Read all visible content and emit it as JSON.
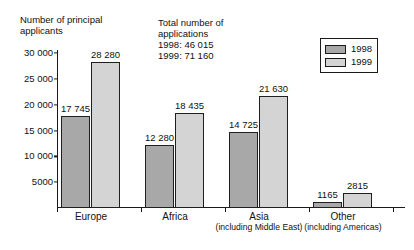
{
  "chart_data": {
    "type": "bar",
    "title": "",
    "ylabel": "Number of principal\napplicants",
    "xlabel": "",
    "ylim": [
      0,
      30000
    ],
    "grid": false,
    "legend_position": "top-right",
    "categories": [
      "Europe",
      "Africa",
      "Asia",
      "Other"
    ],
    "category_sublabels": [
      "",
      "",
      "(including Middle East)",
      "(including Americas)"
    ],
    "yticks": [
      30000,
      25000,
      20000,
      15000,
      10000,
      5000
    ],
    "ytick_labels": [
      "30 000",
      "25 000",
      "20 000",
      "15 000",
      "10 000",
      "5000"
    ],
    "series": [
      {
        "name": "1998",
        "color": "#a8a8a8",
        "values": [
          17745,
          12280,
          14725,
          1165
        ],
        "value_labels": [
          "17 745",
          "12 280",
          "14 725",
          "1165"
        ]
      },
      {
        "name": "1999",
        "color": "#d4d4d4",
        "values": [
          28280,
          18435,
          21630,
          2815
        ],
        "value_labels": [
          "28 280",
          "18 435",
          "21 630",
          "2815"
        ]
      }
    ],
    "annotation": "Total number of\napplications\n1998: 46 015\n1999: 71 160",
    "annotation_lines": [
      "Total number of",
      "applications",
      "1998: 46 015",
      "1999: 71 160"
    ]
  },
  "legend": {
    "items": [
      {
        "label": "1998",
        "color": "#a8a8a8"
      },
      {
        "label": "1999",
        "color": "#d4d4d4"
      }
    ]
  }
}
